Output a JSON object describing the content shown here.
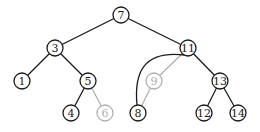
{
  "diagram": {
    "type": "binary-search-tree",
    "colors": {
      "active": "#1a1a1a",
      "removed": "#b0b0b0"
    },
    "node_radius": 8,
    "nodes": [
      {
        "id": "7",
        "label": "7",
        "x": 121,
        "y": 15,
        "state": "active"
      },
      {
        "id": "3",
        "label": "3",
        "x": 55,
        "y": 48,
        "state": "active"
      },
      {
        "id": "11",
        "label": "11",
        "x": 188,
        "y": 48,
        "state": "active"
      },
      {
        "id": "1",
        "label": "1",
        "x": 22,
        "y": 81,
        "state": "active"
      },
      {
        "id": "5",
        "label": "5",
        "x": 88,
        "y": 81,
        "state": "active"
      },
      {
        "id": "9",
        "label": "9",
        "x": 154,
        "y": 81,
        "state": "removed"
      },
      {
        "id": "13",
        "label": "13",
        "x": 220,
        "y": 81,
        "state": "active"
      },
      {
        "id": "4",
        "label": "4",
        "x": 71,
        "y": 113,
        "state": "active"
      },
      {
        "id": "6",
        "label": "6",
        "x": 105,
        "y": 113,
        "state": "removed"
      },
      {
        "id": "8",
        "label": "8",
        "x": 138,
        "y": 113,
        "state": "active"
      },
      {
        "id": "12",
        "label": "12",
        "x": 204,
        "y": 113,
        "state": "active"
      },
      {
        "id": "14",
        "label": "14",
        "x": 238,
        "y": 113,
        "state": "active"
      }
    ],
    "edges": [
      {
        "from": "7",
        "to": "3",
        "state": "active",
        "shape": "line"
      },
      {
        "from": "7",
        "to": "11",
        "state": "active",
        "shape": "line"
      },
      {
        "from": "3",
        "to": "1",
        "state": "active",
        "shape": "line"
      },
      {
        "from": "3",
        "to": "5",
        "state": "active",
        "shape": "line"
      },
      {
        "from": "5",
        "to": "4",
        "state": "active",
        "shape": "line"
      },
      {
        "from": "5",
        "to": "6",
        "state": "removed",
        "shape": "line"
      },
      {
        "from": "11",
        "to": "9",
        "state": "removed",
        "shape": "line"
      },
      {
        "from": "9",
        "to": "8",
        "state": "removed",
        "shape": "line"
      },
      {
        "from": "11",
        "to": "8",
        "state": "active",
        "shape": "curve"
      },
      {
        "from": "11",
        "to": "13",
        "state": "active",
        "shape": "line"
      },
      {
        "from": "13",
        "to": "12",
        "state": "active",
        "shape": "line"
      },
      {
        "from": "13",
        "to": "14",
        "state": "active",
        "shape": "line"
      }
    ]
  }
}
